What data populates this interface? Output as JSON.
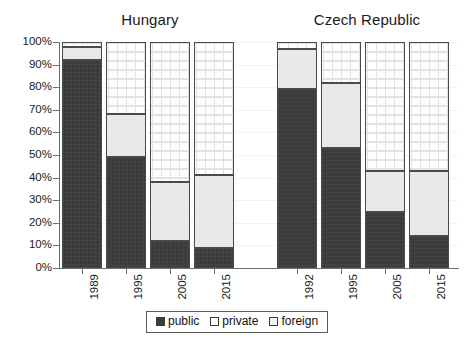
{
  "chart_data": {
    "type": "bar",
    "subtype": "stacked-100-percent",
    "title": "",
    "xlabel": "",
    "ylabel": "",
    "ylim": [
      0,
      100
    ],
    "y_tick_labels": [
      "100%",
      "90%",
      "80%",
      "70%",
      "60%",
      "50%",
      "40%",
      "30%",
      "20%",
      "10%",
      "0%"
    ],
    "y_tick_values": [
      100,
      90,
      80,
      70,
      60,
      50,
      40,
      30,
      20,
      10,
      0
    ],
    "grid": true,
    "legend_position": "bottom",
    "legend": [
      "public",
      "private",
      "foreign"
    ],
    "stack_order_bottom_to_top": [
      "public",
      "foreign",
      "private"
    ],
    "groups": [
      {
        "name": "Hungary",
        "categories": [
          "1989",
          "1995",
          "2005",
          "2015"
        ]
      },
      {
        "name": "Czech Republic",
        "categories": [
          "1992",
          "1995",
          "2005",
          "2015"
        ]
      }
    ],
    "categories": [
      "1989",
      "1995",
      "2005",
      "2015",
      "1992",
      "1995",
      "2005",
      "2015"
    ],
    "series": [
      {
        "name": "public",
        "values": [
          92,
          49,
          12,
          9,
          79,
          53,
          25,
          14
        ]
      },
      {
        "name": "foreign",
        "values": [
          6,
          19,
          26,
          32,
          18,
          29,
          18,
          29
        ]
      },
      {
        "name": "private",
        "values": [
          2,
          32,
          62,
          59,
          3,
          18,
          57,
          57
        ]
      }
    ],
    "bars": [
      {
        "group": "Hungary",
        "category": "1989",
        "public": 92,
        "foreign": 6,
        "private": 2
      },
      {
        "group": "Hungary",
        "category": "1995",
        "public": 49,
        "foreign": 19,
        "private": 32
      },
      {
        "group": "Hungary",
        "category": "2005",
        "public": 12,
        "foreign": 26,
        "private": 62
      },
      {
        "group": "Hungary",
        "category": "2015",
        "public": 9,
        "foreign": 32,
        "private": 59
      },
      {
        "group": "Czech Republic",
        "category": "1992",
        "public": 79,
        "foreign": 18,
        "private": 3
      },
      {
        "group": "Czech Republic",
        "category": "1995",
        "public": 53,
        "foreign": 29,
        "private": 18
      },
      {
        "group": "Czech Republic",
        "category": "2005",
        "public": 25,
        "foreign": 18,
        "private": 57
      },
      {
        "group": "Czech Republic",
        "category": "2015",
        "public": 14,
        "foreign": 29,
        "private": 57
      }
    ],
    "colors": {
      "public": "#3b3b3b",
      "private": "#ffffff",
      "foreign": "#e9e9e9",
      "axis": "#6d6d6d",
      "text": "#1a1a1a",
      "bar_outline": "#4a4a4a"
    }
  }
}
